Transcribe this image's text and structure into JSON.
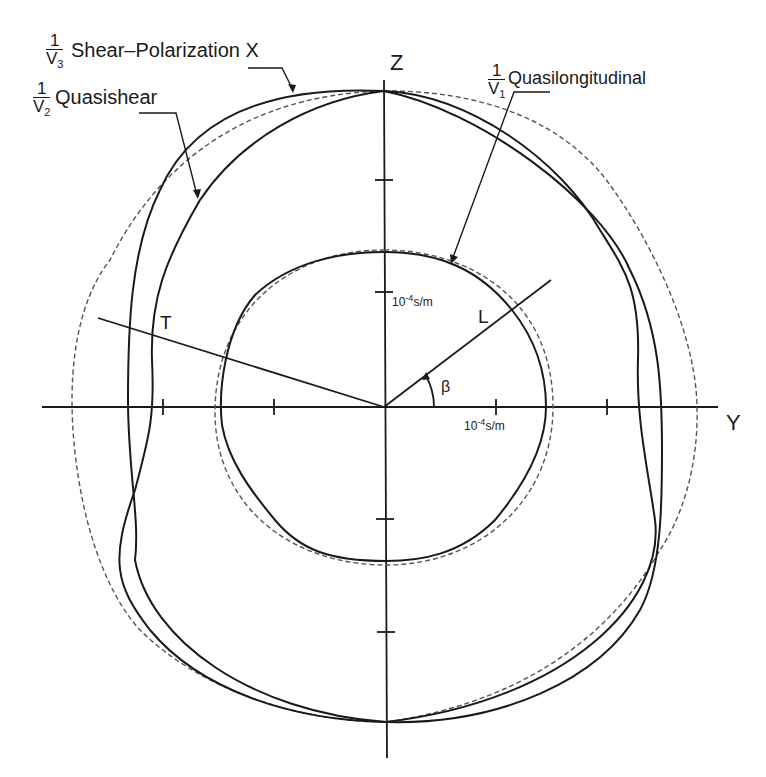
{
  "diagram": {
    "type": "slowness-surface polar diagram",
    "axes": {
      "horizontal_label": "Y",
      "vertical_label": "Z",
      "tick_spacing_unit": "10^-4 s/m"
    },
    "scale_labels": {
      "z_scale": {
        "base": "10",
        "exp": "-4",
        "unit": "s/m"
      },
      "y_scale": {
        "base": "10",
        "exp": "-4",
        "unit": "s/m"
      }
    },
    "curves": [
      {
        "id": "v1",
        "fraction_num": "1",
        "fraction_den": "V",
        "fraction_sub": "1",
        "label": "Quasilongitudinal",
        "style": "solid"
      },
      {
        "id": "v2",
        "fraction_num": "1",
        "fraction_den": "V",
        "fraction_sub": "2",
        "label": "Quasishear",
        "style": "solid"
      },
      {
        "id": "v3",
        "fraction_num": "1",
        "fraction_den": "V",
        "fraction_sub": "3",
        "label": "Shear–Polarization X",
        "style": "solid"
      },
      {
        "id": "iso",
        "label": "isotropic reference",
        "style": "dashed"
      }
    ],
    "rays": {
      "L": "L",
      "T": "T",
      "angle": "β"
    },
    "colors": {
      "ink": "#1a1a1a",
      "dashed": "#555555",
      "background": "#ffffff"
    }
  }
}
